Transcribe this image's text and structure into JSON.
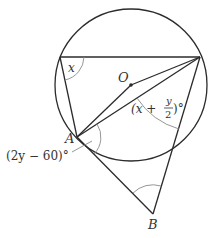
{
  "diagram": {
    "type": "circle-geometry",
    "circle": {
      "center": [
        131,
        85
      ],
      "radius": 76
    },
    "points": {
      "O": {
        "label": "O",
        "pos": [
          131,
          85
        ]
      },
      "A": {
        "label": "A",
        "pos": [
          77,
          137
        ]
      },
      "B": {
        "label": "B",
        "pos": [
          153,
          214
        ]
      },
      "P": {
        "pos": [
          60,
          57
        ]
      },
      "Q": {
        "pos": [
          200,
          57
        ]
      },
      "R": {
        "pos": [
          173,
          148
        ]
      }
    },
    "labels": {
      "x_angle": "x",
      "z_angle": "z",
      "O": "O",
      "A": "A",
      "B": "B",
      "angle_right_prefix": "(x + ",
      "angle_right_num": "y",
      "angle_right_den": "2",
      "angle_right_suffix": ")°",
      "angle_A": "(2y − 60)°"
    },
    "colors": {
      "line": "#2b2b2b",
      "arc": "#8a8a8a",
      "text": "#333333"
    }
  }
}
